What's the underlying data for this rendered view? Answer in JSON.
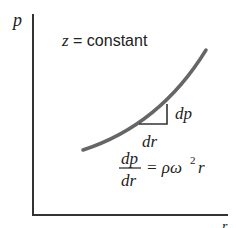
{
  "diagram": {
    "y_axis_label": "p",
    "x_axis_label": "r",
    "condition_label": "z = constant",
    "triangle_vertical_label": "dp",
    "triangle_horizontal_label": "dr",
    "equation": {
      "numerator": "dp",
      "denominator": "dr",
      "rhs": "= ρω",
      "exponent": "2",
      "rhs_tail": "r"
    },
    "colors": {
      "axis": "#333333",
      "curve": "#666666",
      "triangle": "#333333",
      "text": "#222222"
    }
  }
}
